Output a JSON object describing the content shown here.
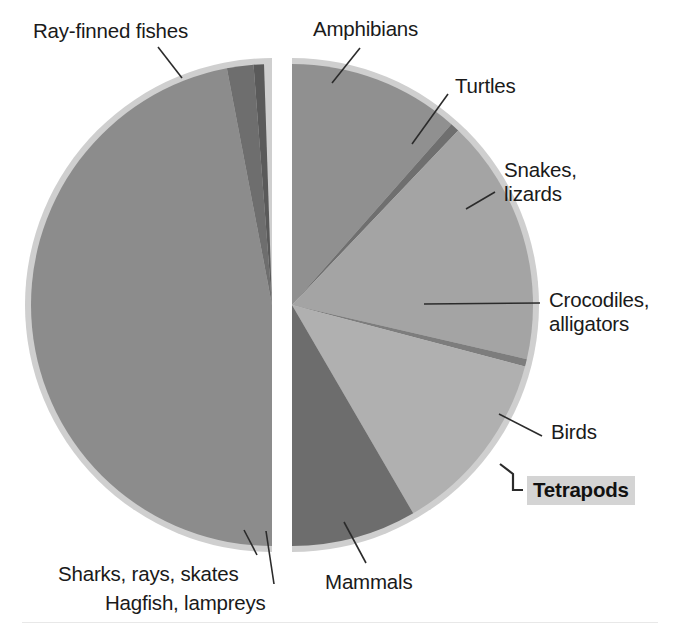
{
  "chart_data": {
    "type": "pie",
    "title": "",
    "subtitle": "",
    "xlabel": "",
    "ylabel": "",
    "legend_position": "callout-labels",
    "grid": false,
    "note": "Vertebrate diversity pie; split into two exploded halves (fishes on left, tetrapods on right). Values are percent of total species.",
    "categories": [
      "Ray-finned fishes",
      "Sharks, rays, skates",
      "Hagfish, lampreys",
      "Amphibians",
      "Turtles",
      "Snakes, lizards",
      "Crocodiles, alligators",
      "Birds",
      "Mammals"
    ],
    "values": [
      47.5,
      1.8,
      0.7,
      11.5,
      0.6,
      16.5,
      0.5,
      12.5,
      8.4
    ],
    "slices": [
      {
        "label": "Ray-finned fishes",
        "value": 47.5,
        "start_deg": 180.0,
        "end_deg": 349.2,
        "color": "#8c8c8c",
        "half": "left"
      },
      {
        "label": "Sharks, rays, skates",
        "value": 1.8,
        "start_deg": 349.2,
        "end_deg": 355.6,
        "color": "#6e6e6e",
        "half": "left"
      },
      {
        "label": "Hagfish, lampreys",
        "value": 0.7,
        "start_deg": 355.6,
        "end_deg": 358.1,
        "color": "#5a5a5a",
        "half": "left"
      },
      {
        "label": "Amphibians",
        "value": 11.5,
        "start_deg": 0.0,
        "end_deg": 41.4,
        "color": "#909090",
        "half": "right"
      },
      {
        "label": "Turtles",
        "value": 0.6,
        "start_deg": 41.4,
        "end_deg": 43.6,
        "color": "#6f6f6f",
        "half": "right"
      },
      {
        "label": "Snakes, lizards",
        "value": 16.5,
        "start_deg": 43.6,
        "end_deg": 103.0,
        "color": "#a4a4a4",
        "half": "right"
      },
      {
        "label": "Crocodiles, alligators",
        "value": 0.5,
        "start_deg": 103.0,
        "end_deg": 104.8,
        "color": "#7d7d7d",
        "half": "right"
      },
      {
        "label": "Birds",
        "value": 12.5,
        "start_deg": 104.8,
        "end_deg": 149.8,
        "color": "#b0b0b0",
        "half": "right"
      },
      {
        "label": "Mammals",
        "value": 8.4,
        "start_deg": 149.8,
        "end_deg": 180.0,
        "color": "#6d6d6d",
        "half": "right"
      }
    ],
    "group_brackets": [
      {
        "label": "Tetrapods",
        "covers": [
          "Amphibians",
          "Turtles",
          "Snakes, lizards",
          "Crocodiles, alligators",
          "Birds",
          "Mammals"
        ]
      }
    ]
  },
  "labels": {
    "ray_finned_fishes": "Ray-finned fishes",
    "amphibians": "Amphibians",
    "turtles": "Turtles",
    "snakes_lizards_line1": "Snakes,",
    "snakes_lizards_line2": "lizards",
    "crocodiles_line1": "Crocodiles,",
    "crocodiles_line2": "alligators",
    "birds": "Birds",
    "mammals": "Mammals",
    "sharks_rays_skates": "Sharks, rays, skates",
    "hagfish_lampreys": "Hagfish, lampreys",
    "tetrapods": "Tetrapods"
  },
  "colors": {
    "halo": "#cfcfcf",
    "background": "#ffffff",
    "leader_line": "#2b2b2b",
    "text": "#1a1a1a",
    "group_label_bg": "#d4d4d4"
  }
}
